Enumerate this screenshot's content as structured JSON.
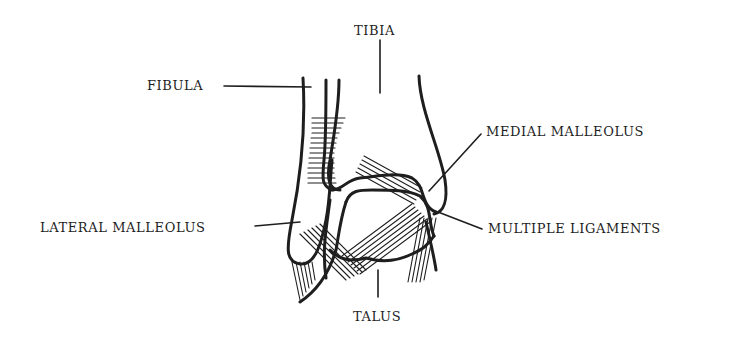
{
  "diagram": {
    "colors": {
      "ink": "#1e1e1e",
      "background": "#ffffff"
    },
    "labels": {
      "tibia": "TIBIA",
      "fibula": "FIBULA",
      "medial_malleolus": "MEDIAL MALLEOLUS",
      "lateral_malleolus": "LATERAL MALLEOLUS",
      "multiple_ligaments": "MULTIPLE LIGAMENTS",
      "talus": "TALUS"
    }
  }
}
